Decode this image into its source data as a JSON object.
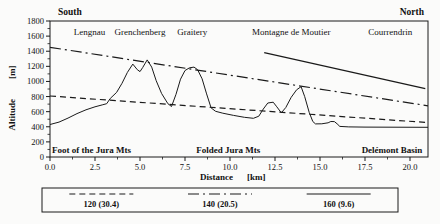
{
  "chart_data": {
    "type": "line",
    "title": "",
    "xlabel": "Distance",
    "xunit": "[km]",
    "ylabel": "Altitude",
    "yunit": "[m]",
    "xlim": [
      0,
      21
    ],
    "ylim": [
      0,
      1800
    ],
    "x_major_ticks": [
      0,
      2.5,
      5,
      7.5,
      10,
      12.5,
      15,
      17.5,
      20
    ],
    "x_major_tick_labels": [
      "0.0",
      "2.5",
      "5.0",
      "7.5",
      "10.0",
      "12.5",
      "15.0",
      "17.5",
      "20.0"
    ],
    "x_minor_step": 1.25,
    "y_major_step": 200,
    "y_minor_step": 100,
    "grid": "off",
    "ink_color": "#1a1a1a",
    "direction_labels": {
      "south": "South",
      "north": "North"
    },
    "top_labels": [
      {
        "text": "Lengnau",
        "x_km": 2.2
      },
      {
        "text": "Grenchenberg",
        "x_km": 5.0
      },
      {
        "text": "Graitery",
        "x_km": 7.9
      },
      {
        "text": "Montagne de Moutier",
        "x_km": 13.4
      },
      {
        "text": "Courrendrin",
        "x_km": 18.9
      }
    ],
    "bottom_labels": [
      {
        "text": "Foot of the Jura Mts",
        "x_km": 2.3
      },
      {
        "text": "Folded Jura Mts",
        "x_km": 9.9
      },
      {
        "text": "Delémont Basin",
        "x_km": 19.0
      }
    ],
    "series": [
      {
        "id": "topographic-profile",
        "name": "Topographic profile",
        "style": "solid",
        "stroke_width": 1,
        "points": [
          [
            0,
            430
          ],
          [
            0.5,
            462
          ],
          [
            1.0,
            515
          ],
          [
            1.5,
            575
          ],
          [
            2.0,
            625
          ],
          [
            2.5,
            665
          ],
          [
            2.9,
            690
          ],
          [
            3.15,
            705
          ],
          [
            3.35,
            775
          ],
          [
            3.7,
            855
          ],
          [
            4.0,
            975
          ],
          [
            4.3,
            1120
          ],
          [
            4.6,
            1230
          ],
          [
            4.85,
            1155
          ],
          [
            5.0,
            1130
          ],
          [
            5.15,
            1185
          ],
          [
            5.4,
            1285
          ],
          [
            5.65,
            1190
          ],
          [
            5.9,
            1010
          ],
          [
            6.2,
            840
          ],
          [
            6.55,
            705
          ],
          [
            6.75,
            668
          ],
          [
            7.0,
            830
          ],
          [
            7.25,
            1030
          ],
          [
            7.5,
            1145
          ],
          [
            7.75,
            1180
          ],
          [
            8.0,
            1190
          ],
          [
            8.2,
            1155
          ],
          [
            8.45,
            1035
          ],
          [
            8.7,
            835
          ],
          [
            8.95,
            650
          ],
          [
            9.2,
            605
          ],
          [
            9.6,
            580
          ],
          [
            10.2,
            550
          ],
          [
            10.8,
            525
          ],
          [
            11.3,
            512
          ],
          [
            11.6,
            540
          ],
          [
            11.85,
            635
          ],
          [
            12.1,
            715
          ],
          [
            12.4,
            725
          ],
          [
            12.6,
            665
          ],
          [
            12.85,
            585
          ],
          [
            13.1,
            655
          ],
          [
            13.4,
            790
          ],
          [
            13.7,
            890
          ],
          [
            13.95,
            930
          ],
          [
            14.15,
            800
          ],
          [
            14.4,
            590
          ],
          [
            14.6,
            470
          ],
          [
            14.75,
            438
          ],
          [
            15.1,
            440
          ],
          [
            15.45,
            452
          ],
          [
            15.6,
            470
          ],
          [
            15.8,
            468
          ],
          [
            15.95,
            440
          ],
          [
            16.1,
            405
          ],
          [
            16.6,
            398
          ],
          [
            17.5,
            396
          ],
          [
            19.0,
            395
          ],
          [
            21,
            393
          ]
        ]
      },
      {
        "id": "isoline-120",
        "name": "120 (30.4)",
        "style": "dashed",
        "stroke_width": 1.2,
        "points": [
          [
            0,
            808
          ],
          [
            21,
            455
          ]
        ]
      },
      {
        "id": "isoline-140",
        "name": "140 (20.5)",
        "style": "dashdot",
        "stroke_width": 1.2,
        "points": [
          [
            0,
            1452
          ],
          [
            21,
            678
          ]
        ]
      },
      {
        "id": "isoline-160",
        "name": "160 (9.6)",
        "style": "solid",
        "stroke_width": 1.2,
        "points": [
          [
            11.9,
            1380
          ],
          [
            20.85,
            905
          ]
        ]
      }
    ],
    "legend": {
      "position": "bottom",
      "items": [
        {
          "id": "legend-120",
          "label": "120 (30.4)",
          "style": "dashed"
        },
        {
          "id": "legend-140",
          "label": "140 (20.5)",
          "style": "dashdot"
        },
        {
          "id": "legend-160",
          "label": "160 (9.6)",
          "style": "solid"
        }
      ]
    }
  }
}
